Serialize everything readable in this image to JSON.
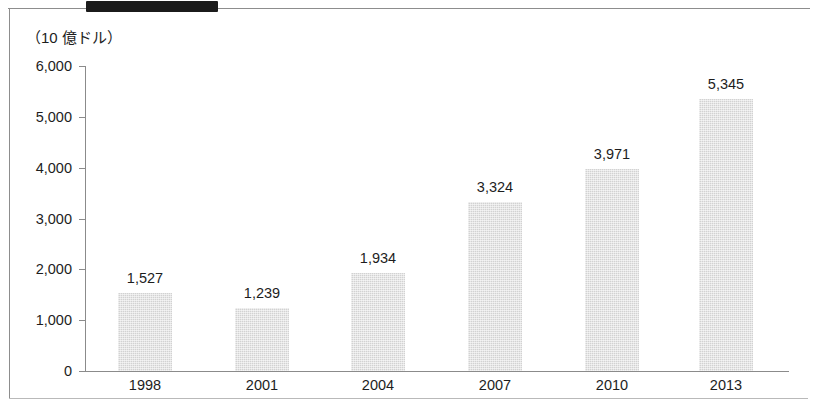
{
  "chart_data": {
    "type": "bar",
    "title": "",
    "subtitle": "",
    "unit_label": "（10 億ドル）",
    "xlabel": "",
    "ylabel": "",
    "categories": [
      "1998",
      "2001",
      "2004",
      "2007",
      "2010",
      "2013"
    ],
    "values": [
      1527,
      1239,
      1934,
      3324,
      3971,
      5345
    ],
    "value_labels": [
      "1,527",
      "1,239",
      "1,934",
      "3,324",
      "3,971",
      "5,345"
    ],
    "y_ticks": [
      0,
      1000,
      2000,
      3000,
      4000,
      5000,
      6000
    ],
    "y_tick_labels": [
      "0",
      "1,000",
      "2,000",
      "3,000",
      "4,000",
      "5,000",
      "6,000"
    ],
    "ylim": [
      0,
      6000
    ],
    "grid": false,
    "legend": null,
    "bar_color": "#d2d2d2",
    "axis_color": "#8b8b8b",
    "text_color": "#1d1d1d"
  },
  "artifacts": {
    "redaction_color": "#1b1b1b",
    "frame_color": "#8d8d8d"
  }
}
